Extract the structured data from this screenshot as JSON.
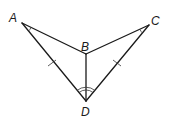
{
  "diagram": {
    "type": "geometry-figure",
    "points": {
      "A": {
        "label": "A",
        "x": 22,
        "y": 23
      },
      "B": {
        "label": "B",
        "x": 86,
        "y": 54
      },
      "C": {
        "label": "C",
        "x": 149,
        "y": 25
      },
      "D": {
        "label": "D",
        "x": 86,
        "y": 101
      }
    },
    "segments": [
      "AB",
      "BC",
      "BD",
      "AD",
      "CD"
    ],
    "congruent_segments": [
      "AD",
      "CD"
    ],
    "congruent_angles": [
      "ADB",
      "CDB"
    ],
    "angle_marks_at_A_and_C": true
  }
}
